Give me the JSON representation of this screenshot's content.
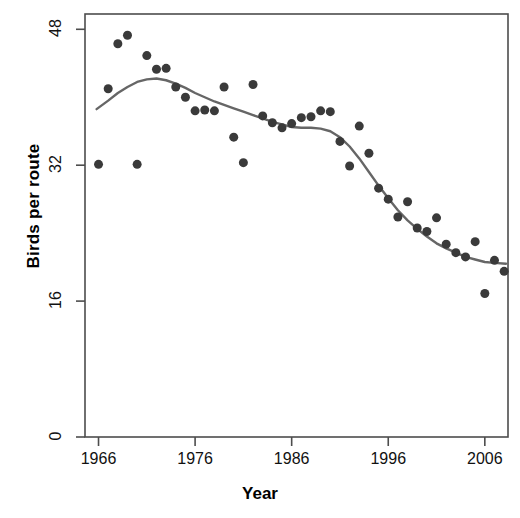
{
  "chart_data": {
    "type": "scatter",
    "title": "",
    "subtitle": "",
    "xlabel": "Year",
    "ylabel": "Birds per route",
    "xlim": [
      1964.6,
      2008.4
    ],
    "ylim": [
      0,
      49.8
    ],
    "xticks": [
      1966,
      1976,
      1986,
      1996,
      2006
    ],
    "xticklabels": [
      "1966",
      "1976",
      "1986",
      "1996",
      "2006"
    ],
    "yticks": [
      0,
      16,
      32,
      48
    ],
    "yticklabels": [
      "0",
      "16",
      "32",
      "48"
    ],
    "grid": false,
    "legend": null,
    "annotations": [],
    "point_color": "#3a3a3a",
    "line_color": "#666666",
    "axis_color": "#4d4d4d",
    "marker": "circle",
    "marker_size": 9,
    "series": [
      {
        "name": "Birds per route",
        "kind": "points",
        "x": [
          1966,
          1967,
          1968,
          1969,
          1970,
          1971,
          1972,
          1973,
          1974,
          1975,
          1976,
          1977,
          1978,
          1979,
          1980,
          1981,
          1982,
          1983,
          1984,
          1985,
          1986,
          1987,
          1988,
          1989,
          1990,
          1991,
          1992,
          1993,
          1994,
          1995,
          1996,
          1997,
          1998,
          1999,
          2000,
          2001,
          2002,
          2003,
          2004,
          2005,
          2006,
          2007,
          2008
        ],
        "y": [
          32.1,
          41.0,
          46.3,
          47.3,
          32.1,
          44.9,
          43.3,
          43.4,
          41.2,
          40.0,
          38.4,
          38.5,
          38.4,
          41.2,
          35.3,
          32.3,
          41.5,
          37.8,
          37.0,
          36.4,
          36.9,
          37.6,
          37.7,
          38.4,
          38.3,
          34.8,
          31.9,
          36.6,
          33.4,
          29.3,
          28.0,
          25.9,
          27.7,
          24.6,
          24.2,
          25.8,
          22.7,
          21.7,
          21.2,
          23.0,
          16.9,
          20.8,
          19.5
        ]
      },
      {
        "name": "LOESS smooth",
        "kind": "line",
        "x": [
          1965.8,
          1967,
          1968,
          1969,
          1970,
          1971,
          1972,
          1973,
          1974,
          1975,
          1976,
          1977,
          1978,
          1979,
          1980,
          1981,
          1982,
          1983,
          1984,
          1985,
          1986,
          1987,
          1988,
          1989,
          1990,
          1991,
          1992,
          1993,
          1994,
          1995,
          1996,
          1997,
          1998,
          1999,
          2000,
          2001,
          2002,
          2003,
          2004,
          2005,
          2006,
          2007,
          2008.2
        ],
        "y": [
          38.6,
          39.6,
          40.5,
          41.2,
          41.8,
          42.1,
          42.2,
          42.0,
          41.6,
          41.1,
          40.5,
          40.0,
          39.5,
          39.1,
          38.7,
          38.3,
          37.9,
          37.5,
          37.1,
          36.8,
          36.5,
          36.4,
          36.4,
          36.3,
          36.0,
          35.3,
          34.2,
          32.8,
          31.2,
          29.6,
          28.1,
          26.7,
          25.5,
          24.5,
          23.6,
          22.8,
          22.2,
          21.7,
          21.2,
          20.9,
          20.6,
          20.5,
          20.4
        ]
      }
    ]
  },
  "axis": {
    "y_title": "Birds per route",
    "x_title": "Year"
  }
}
